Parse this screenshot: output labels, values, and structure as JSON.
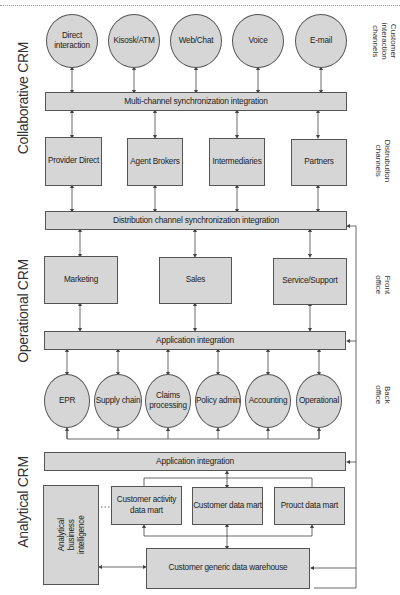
{
  "sections": {
    "collaborative": "Collaborative CRM",
    "operational": "Operational CRM",
    "analytical": "Analytical CRM"
  },
  "side_labels": {
    "customer_interaction": "Customer\ninteraction\nchannels",
    "distribution": "Distrubution\nchannels",
    "front_office": "Front\noffice",
    "back_office": "Back\noffice"
  },
  "interaction_channels": [
    "Direct\ninteraction",
    "Kisosk/ATM",
    "Web/Chat",
    "Voice",
    "E-mail"
  ],
  "bars": {
    "multichannel": "Multi-channel synchronization integration",
    "distribution_sync": "Distribution channel synchronization integration",
    "app_integration_1": "Application integration",
    "app_integration_2": "Application integration"
  },
  "distribution_channels": [
    "Provider Direct",
    "Agent Brokers",
    "Intermediaries",
    "Partners"
  ],
  "front_office": [
    "Marketing",
    "Sales",
    "Service/Support"
  ],
  "back_office": [
    "EPR",
    "Supply chain",
    "Claims\nprocessing",
    "Policy admin",
    "Accounting",
    "Operational"
  ],
  "analytical": {
    "bi": "Analytical\nbusiness\nintelligence",
    "marts": [
      "Customer activity\ndata mart",
      "Customer data mart",
      "Prouct data mart"
    ],
    "warehouse": "Customer generic data warehouse"
  },
  "colors": {
    "fill": "#d6d6d6",
    "stroke": "#555555",
    "text": "#222222"
  }
}
